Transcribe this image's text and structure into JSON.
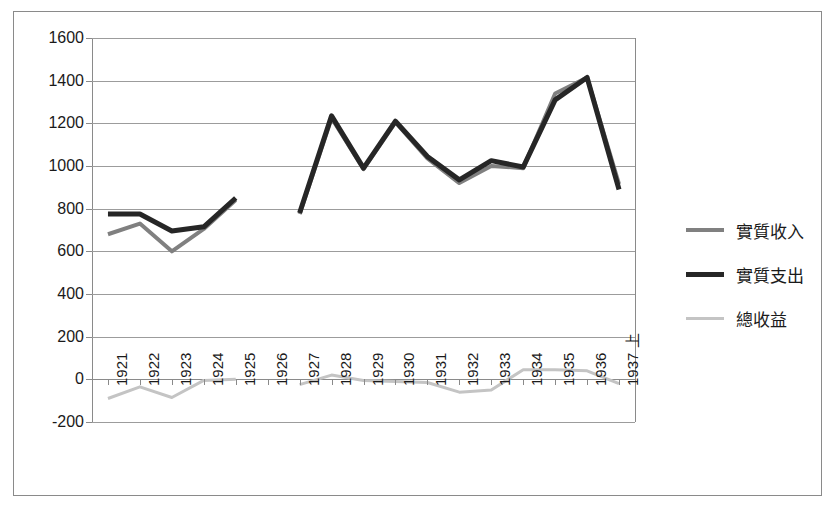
{
  "chart_data": {
    "type": "line",
    "title": "",
    "subtitle": "",
    "xlabel": "",
    "ylabel": "",
    "ylim": [
      -200,
      1600
    ],
    "ytick_step": 200,
    "grid": true,
    "legend_position": "right",
    "categories": [
      "1921",
      "1922",
      "1923",
      "1924",
      "1925",
      "1926",
      "1927",
      "1928",
      "1929",
      "1930",
      "1931",
      "1932",
      "1933",
      "1934",
      "1935",
      "1936",
      "1937 上"
    ],
    "yticks": [
      "1600",
      "1400",
      "1200",
      "1000",
      "800",
      "600",
      "400",
      "200",
      "0",
      "-200"
    ],
    "series": [
      {
        "name": "實質收入",
        "color": "#808080",
        "width": 4,
        "values": [
          680,
          730,
          600,
          705,
          840,
          null,
          775,
          1225,
          985,
          1205,
          1035,
          920,
          1000,
          990,
          1340,
          1415,
          915
        ]
      },
      {
        "name": "實質支出",
        "color": "#262626",
        "width": 5,
        "values": [
          775,
          775,
          695,
          715,
          850,
          null,
          780,
          1235,
          990,
          1210,
          1045,
          935,
          1025,
          995,
          1310,
          1415,
          890
        ]
      },
      {
        "name": "總收益",
        "color": "#c4c4c4",
        "width": 3,
        "values": [
          -90,
          -35,
          -85,
          -5,
          0,
          null,
          -25,
          20,
          -5,
          -10,
          -15,
          -60,
          -50,
          45,
          45,
          40,
          -20
        ]
      }
    ]
  },
  "legend": {
    "items": [
      {
        "label": "實質收入",
        "color": "#808080",
        "weight": "normal"
      },
      {
        "label": "實質支出",
        "color": "#262626",
        "weight": "thick"
      },
      {
        "label": "總收益",
        "color": "#c4c4c4",
        "weight": "thin"
      }
    ]
  },
  "colors": {
    "frame": "#8a8a8a",
    "gridline": "#9c9c9c",
    "axis": "#8a8a8a",
    "text": "#1a1a1a",
    "background": "#ffffff"
  }
}
